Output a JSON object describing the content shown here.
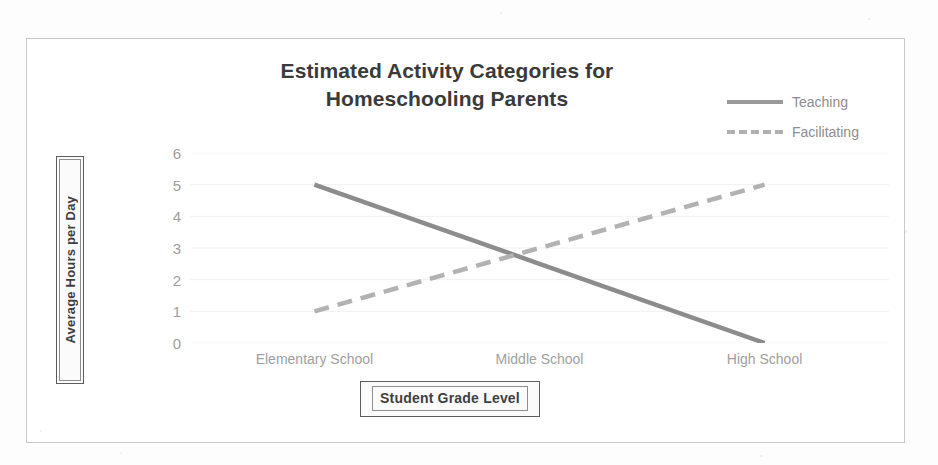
{
  "chart_data": {
    "type": "line",
    "title": "Estimated Activity Categories for Homeschooling Parents",
    "title_line1": "Estimated Activity Categories for",
    "title_line2": "Homeschooling Parents",
    "xlabel": "Student Grade Level",
    "ylabel": "Average Hours per Day",
    "categories": [
      "Elementary School",
      "Middle School",
      "High School"
    ],
    "yticks": [
      "6",
      "5",
      "4",
      "3",
      "2",
      "1",
      "0"
    ],
    "ylim": [
      0,
      6
    ],
    "grid": true,
    "legend_position": "top-right",
    "series": [
      {
        "name": "Teaching",
        "style": "solid",
        "color": "#8c8c8c",
        "values": [
          5,
          2.5,
          0
        ]
      },
      {
        "name": "Facilitating",
        "style": "dashed",
        "color": "#b2b2b2",
        "values": [
          1,
          3,
          5
        ]
      }
    ]
  },
  "legend": {
    "items": [
      {
        "label": "Teaching",
        "style": "solid"
      },
      {
        "label": "Facilitating",
        "style": "dashed"
      }
    ]
  }
}
